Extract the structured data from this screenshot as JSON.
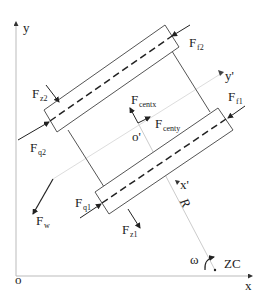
{
  "diagram": {
    "axes": {
      "origin_label": "o",
      "x_label": "x",
      "y_label": "y",
      "local_origin_label": "o'",
      "local_x_label": "x'",
      "local_y_label": "y'"
    },
    "labels": {
      "Ff2": {
        "main": "F",
        "sub": "f2"
      },
      "Fz2": {
        "main": "F",
        "sub": "z2"
      },
      "Fq2": {
        "main": "F",
        "sub": "q2"
      },
      "Fcentx": {
        "main": "F",
        "sub": "centx"
      },
      "Fcenty": {
        "main": "F",
        "sub": "centy"
      },
      "Ff1": {
        "main": "F",
        "sub": "f1"
      },
      "Fw": {
        "main": "F",
        "sub": "w"
      },
      "Fq1": {
        "main": "F",
        "sub": "q1"
      },
      "Fz1": {
        "main": "F",
        "sub": "z1"
      },
      "R": "R",
      "omega": "ω",
      "ZC": "ZC"
    },
    "colors": {
      "line": "#444444",
      "axis": "#bbbbbb",
      "light_axis": "#dddddd"
    }
  }
}
